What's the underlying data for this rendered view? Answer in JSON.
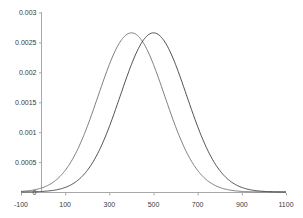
{
  "chart_data": {
    "type": "line",
    "title": "",
    "subtitle": "",
    "xlabel": "",
    "ylabel": "",
    "grid": false,
    "legend": "none",
    "xlim": [
      -100,
      1100
    ],
    "ylim": [
      0,
      0.003
    ],
    "x_ticks": [
      "-100",
      "100",
      "300",
      "500",
      "700",
      "900",
      "1100"
    ],
    "x_tick_values": [
      -100,
      100,
      300,
      500,
      700,
      900,
      1100
    ],
    "y_ticks": [
      "0",
      "0.0005",
      "0.001",
      "0.0015",
      "0.002",
      "0.0025",
      "0.003"
    ],
    "y_tick_values": [
      0,
      0.0005,
      0.001,
      0.0015,
      0.002,
      0.0025,
      0.003
    ],
    "axis_color": "#9a9a9a",
    "series": [
      {
        "name": "curve-left",
        "color": "#6f6f6f",
        "mean": 400,
        "sigma": 150,
        "peak_value": 0.00266,
        "x": [
          0,
          50,
          100,
          150,
          200,
          250,
          300,
          350,
          400,
          450,
          500,
          550,
          600,
          650,
          700,
          750,
          800,
          850,
          900,
          950,
          1000
        ],
        "values": [
          8.7e-06,
          4.09e-05,
          0.00014,
          0.000364,
          0.00073,
          0.001257,
          0.001824,
          0.002251,
          0.00266,
          0.002251,
          0.001824,
          0.001257,
          0.00073,
          0.000364,
          0.00014,
          4.09e-05,
          8.7e-06,
          1.3e-06,
          1.5e-07,
          1e-08,
          0.0
        ]
      },
      {
        "name": "curve-right",
        "color": "#3c3c3c",
        "mean": 500,
        "sigma": 150,
        "peak_value": 0.00266,
        "x": [
          0,
          50,
          100,
          150,
          200,
          250,
          300,
          350,
          400,
          450,
          500,
          550,
          600,
          650,
          700,
          750,
          800,
          850,
          900,
          950,
          1000,
          1050,
          1100
        ],
        "values": [
          4e-07,
          2.6e-06,
          8.7e-06,
          4.09e-05,
          0.00014,
          0.000364,
          0.00073,
          0.001257,
          0.001824,
          0.002251,
          0.00266,
          0.002251,
          0.001824,
          0.001257,
          0.00073,
          0.000364,
          0.00014,
          4.09e-05,
          8.7e-06,
          1.3e-06,
          1.5e-07,
          1e-08,
          0.0
        ]
      }
    ]
  }
}
